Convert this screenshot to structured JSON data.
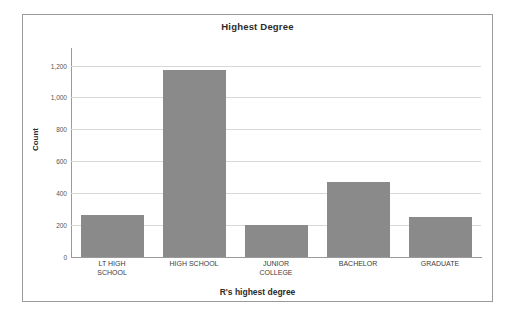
{
  "chart_data": {
    "type": "bar",
    "title": "Highest Degree",
    "xlabel": "R's highest degree",
    "ylabel": "Count",
    "categories": [
      "LT HIGH\nSCHOOL",
      "HIGH SCHOOL",
      "JUNIOR\nCOLLEGE",
      "BACHELOR",
      "GRADUATE"
    ],
    "values": [
      265,
      1175,
      202,
      473,
      253
    ],
    "ylim": [
      0,
      1260
    ],
    "yticks": [
      0,
      200,
      400,
      600,
      800,
      1000,
      1200
    ],
    "ytick_labels": [
      "0",
      "200",
      "400",
      "600",
      "800",
      "1,000",
      "1,200"
    ],
    "grid": true,
    "legend": null,
    "bar_color": "#8a8a8a",
    "gridline_color": "#d8d8d8",
    "axis_color": "#9a9a9a",
    "frame_color": "#9a9a9a",
    "background": "#ffffff"
  }
}
